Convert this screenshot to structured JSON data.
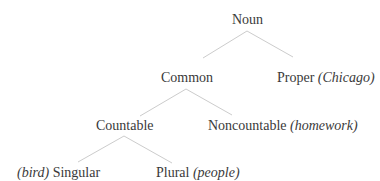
{
  "diagram": {
    "type": "tree",
    "line_color": "#cccccc",
    "text_color": "#3a3a3a",
    "nodes": {
      "noun": {
        "label": "Noun"
      },
      "common": {
        "label": "Common"
      },
      "proper": {
        "label": "Proper",
        "example": "(Chicago)"
      },
      "countable": {
        "label": "Countable"
      },
      "noncountable": {
        "label": "Noncountable",
        "example": "(homework)"
      },
      "singular": {
        "label": "Singular",
        "example": "(bird)"
      },
      "plural": {
        "label": "Plural",
        "example": "(people)"
      }
    },
    "edges": [
      {
        "from": "Noun",
        "to": "Common"
      },
      {
        "from": "Noun",
        "to": "Proper"
      },
      {
        "from": "Common",
        "to": "Countable"
      },
      {
        "from": "Common",
        "to": "Noncountable"
      },
      {
        "from": "Countable",
        "to": "Singular"
      },
      {
        "from": "Countable",
        "to": "Plural"
      }
    ]
  }
}
